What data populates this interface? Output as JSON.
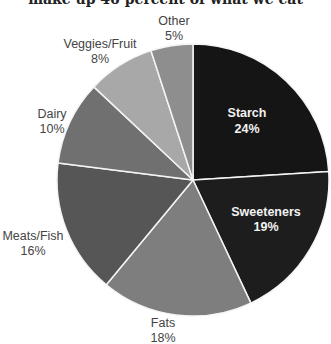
{
  "chart_data": {
    "type": "pie",
    "title": "make up 46 percent of what we eat",
    "title_cropped": true,
    "categories": [
      "Starch",
      "Sweeteners",
      "Fats",
      "Meats/Fish",
      "Dairy",
      "Veggies/Fruit",
      "Other"
    ],
    "values": [
      24,
      19,
      18,
      16,
      10,
      8,
      5
    ],
    "unit": "%",
    "start_angle_deg": 0,
    "direction": "clockwise",
    "colors": [
      "#151515",
      "#1d1d1d",
      "#7e7e7e",
      "#565656",
      "#707070",
      "#a8a8a8",
      "#8e8e8e"
    ],
    "labels": [
      {
        "name": "Starch",
        "value": "24%"
      },
      {
        "name": "Sweeteners",
        "value": "19%"
      },
      {
        "name": "Fats",
        "value": "18%"
      },
      {
        "name": "Meats/Fish",
        "value": "16%"
      },
      {
        "name": "Dairy",
        "value": "10%"
      },
      {
        "name": "Veggies/Fruit",
        "value": "8%"
      },
      {
        "name": "Other",
        "value": "5%"
      }
    ],
    "legend": "none"
  }
}
